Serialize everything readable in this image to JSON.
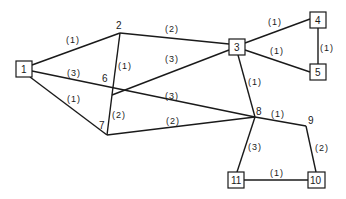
{
  "diagram": {
    "type": "weighted-graph",
    "colors": {
      "stroke": "#1a1a1a",
      "background": "#ffffff"
    },
    "nodes": [
      {
        "id": "1",
        "label": "1",
        "shape": "box",
        "x": 24,
        "y": 69
      },
      {
        "id": "2",
        "label": "2",
        "shape": "point",
        "x": 120,
        "y": 33
      },
      {
        "id": "3",
        "label": "3",
        "shape": "box",
        "x": 237,
        "y": 47
      },
      {
        "id": "4",
        "label": "4",
        "shape": "box",
        "x": 318,
        "y": 20
      },
      {
        "id": "5",
        "label": "5",
        "shape": "box",
        "x": 318,
        "y": 72
      },
      {
        "id": "6",
        "label": "6",
        "shape": "point",
        "x": 112,
        "y": 95
      },
      {
        "id": "7",
        "label": "7",
        "shape": "point",
        "x": 107,
        "y": 135
      },
      {
        "id": "8",
        "label": "8",
        "shape": "point",
        "x": 255,
        "y": 117
      },
      {
        "id": "9",
        "label": "9",
        "shape": "point",
        "x": 306,
        "y": 126
      },
      {
        "id": "10",
        "label": "10",
        "shape": "box",
        "x": 316,
        "y": 180
      },
      {
        "id": "11",
        "label": "11",
        "shape": "box",
        "x": 236,
        "y": 180
      }
    ],
    "edges": [
      {
        "from": "1",
        "to": "2",
        "weight": "(1)"
      },
      {
        "from": "1",
        "to": "8",
        "weight": "(3)"
      },
      {
        "from": "1",
        "to": "7",
        "weight": "(1)"
      },
      {
        "from": "2",
        "to": "3",
        "weight": "(2)"
      },
      {
        "from": "2",
        "to": "6",
        "weight": "(1)"
      },
      {
        "from": "6",
        "to": "3",
        "weight": "(3)"
      },
      {
        "from": "6",
        "to": "8",
        "weight": "(3)"
      },
      {
        "from": "6",
        "to": "7",
        "weight": "(2)"
      },
      {
        "from": "7",
        "to": "8",
        "weight": "(2)"
      },
      {
        "from": "3",
        "to": "4",
        "weight": "(1)"
      },
      {
        "from": "3",
        "to": "5",
        "weight": "(1)"
      },
      {
        "from": "4",
        "to": "5",
        "weight": "(1)"
      },
      {
        "from": "3",
        "to": "8",
        "weight": "(1)"
      },
      {
        "from": "8",
        "to": "9",
        "weight": "(1)"
      },
      {
        "from": "8",
        "to": "11",
        "weight": "(3)"
      },
      {
        "from": "9",
        "to": "10",
        "weight": "(2)"
      },
      {
        "from": "11",
        "to": "10",
        "weight": "(1)"
      }
    ]
  }
}
